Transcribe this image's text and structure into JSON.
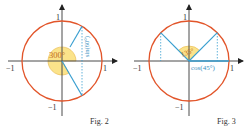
{
  "colors": {
    "circle": "#e2552a",
    "axis": "#4a4a4a",
    "ray": "#3a9fd0",
    "sector_fill": "#fbe38a",
    "sector_stroke": "#e8b74a",
    "label": "#333333",
    "ray_label": "#3a8fc0",
    "angle_label": "#c06a20"
  },
  "figures": [
    {
      "id": "fig2",
      "caption": "Fig. 2",
      "axis_labels": {
        "x_pos": "1",
        "x_neg": "−1",
        "y_pos": "1",
        "y_neg": "−1"
      },
      "angle_label": "300°",
      "ray_label": "sin(60°)",
      "angle_deg": 300
    },
    {
      "id": "fig3",
      "caption": "Fig. 3",
      "axis_labels": {
        "x_pos": "1",
        "x_neg": "−1",
        "y_pos": "1",
        "y_neg": "−1"
      },
      "angle_label": "135°",
      "ray_label": "cos(45°)",
      "angle_deg": 135
    }
  ]
}
